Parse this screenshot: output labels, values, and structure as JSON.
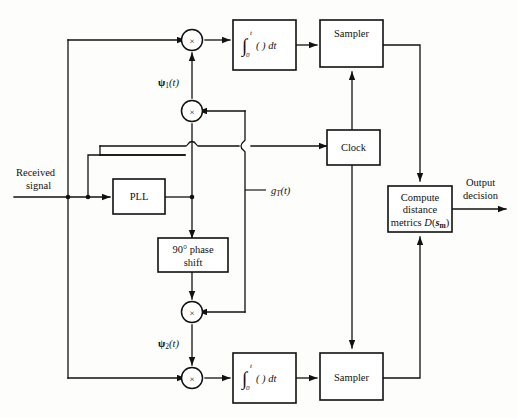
{
  "figure": {
    "type": "block-diagram",
    "background_color": "#fdfdfb",
    "line_color": "#111111"
  },
  "blocks": {
    "integrator_top": {
      "symbol": "∫",
      "lower_limit": "0",
      "upper_limit": "t",
      "body": "( ) dt"
    },
    "integrator_bottom": {
      "symbol": "∫",
      "lower_limit": "0",
      "upper_limit": "t",
      "body": "( ) dt"
    },
    "sampler_top": {
      "label": "Sampler"
    },
    "sampler_bottom": {
      "label": "Sampler"
    },
    "clock": {
      "label": "Clock"
    },
    "pll": {
      "label": "PLL"
    },
    "phase_shift": {
      "line1": "90° phase",
      "line2": "shift"
    },
    "compute": {
      "line1": "Compute",
      "line2": "distance",
      "line3_pre": "metrics ",
      "line3_fn": "D",
      "line3_open": "(",
      "line3_vec": "s",
      "line3_sub": "m",
      "line3_close": ")"
    }
  },
  "multipliers": {
    "glyph": "×",
    "names": [
      "mixer-top-signal",
      "mixer-top-carrier",
      "mixer-bottom-carrier",
      "mixer-bottom-signal"
    ]
  },
  "labels": {
    "received_signal_line1": "Received",
    "received_signal_line2": "signal",
    "output_decision_line1": "Output",
    "output_decision_line2": "decision",
    "psi1_sym": "ψ",
    "psi1_sub": "1",
    "psi1_arg": "(t)",
    "psi2_sym": "ψ",
    "psi2_sub": "2",
    "psi2_arg": "(t)",
    "gt_sym": "g",
    "gt_sub": "T",
    "gt_arg": "(t)"
  }
}
